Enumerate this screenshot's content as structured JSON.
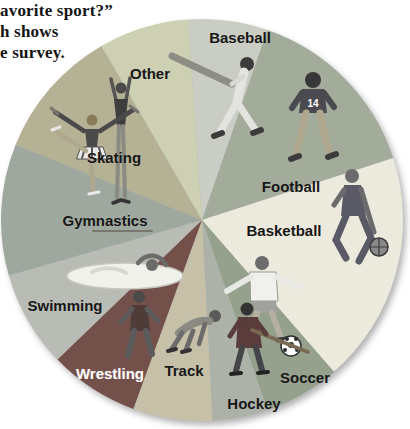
{
  "caption": {
    "line1": "avorite sport?”",
    "line2": "h shows",
    "line3": "e survey."
  },
  "chart_data": {
    "type": "pie",
    "title": "",
    "legend": "none",
    "labels_on_slices": true,
    "angle_convention": "degrees clockwise from 12 o'clock",
    "center": [
      202,
      220
    ],
    "radius": 201,
    "slices": [
      {
        "label": "Baseball",
        "start_deg": -4,
        "end_deg": 19,
        "angle_deg": 23,
        "approx_percent": 6,
        "color": "#c9cdc3",
        "label_color": "#161616",
        "label_pos": [
          240,
          37
        ]
      },
      {
        "label": "Football",
        "start_deg": 19,
        "end_deg": 72,
        "angle_deg": 53,
        "approx_percent": 15,
        "color": "#a3ab9b",
        "label_color": "#161616",
        "label_pos": [
          291,
          186
        ]
      },
      {
        "label": "Basketball",
        "start_deg": 72,
        "end_deg": 139,
        "angle_deg": 67,
        "approx_percent": 19,
        "color": "#eceadd",
        "label_color": "#161616",
        "label_pos": [
          284,
          230
        ]
      },
      {
        "label": "Soccer",
        "start_deg": 139,
        "end_deg": 161,
        "angle_deg": 22,
        "approx_percent": 6,
        "color": "#95a18d",
        "label_color": "#161616",
        "label_pos": [
          305,
          377
        ]
      },
      {
        "label": "Hockey",
        "start_deg": 161,
        "end_deg": 177,
        "angle_deg": 16,
        "approx_percent": 4,
        "color": "#adb2a9",
        "label_color": "#161616",
        "label_pos": [
          254,
          403
        ]
      },
      {
        "label": "Track",
        "start_deg": 177,
        "end_deg": 200,
        "angle_deg": 23,
        "approx_percent": 6,
        "color": "#c6c0a8",
        "label_color": "#161616",
        "label_pos": [
          184,
          370
        ]
      },
      {
        "label": "Wrestling",
        "start_deg": 200,
        "end_deg": 226,
        "angle_deg": 26,
        "approx_percent": 7,
        "color": "#74504b",
        "label_color": "#ffffff",
        "label_pos": [
          110,
          373
        ]
      },
      {
        "label": "Swimming",
        "start_deg": 226,
        "end_deg": 254,
        "angle_deg": 28,
        "approx_percent": 8,
        "color": "#b8bcb4",
        "label_color": "#161616",
        "label_pos": [
          65,
          305
        ]
      },
      {
        "label": "Gymnastics",
        "start_deg": 254,
        "end_deg": 292,
        "angle_deg": 38,
        "approx_percent": 11,
        "color": "#9fa89e",
        "label_color": "#161616",
        "label_pos": [
          105,
          220
        ]
      },
      {
        "label": "Skating",
        "start_deg": 292,
        "end_deg": 330,
        "angle_deg": 38,
        "approx_percent": 11,
        "color": "#b5b194",
        "label_color": "#161616",
        "label_pos": [
          114,
          157
        ]
      },
      {
        "label": "Other",
        "start_deg": 330,
        "end_deg": 356,
        "angle_deg": 26,
        "approx_percent": 7,
        "color": "#cdd0b2",
        "label_color": "#161616",
        "label_pos": [
          150,
          73
        ]
      }
    ]
  },
  "illustrations": {
    "football_jersey_number": "14",
    "figures": [
      "baseball-bat",
      "baseball-batter",
      "football-player",
      "basketball-player",
      "soccer-player",
      "soccer-ball",
      "hockey-player",
      "track-runner",
      "wrestler",
      "swimmer",
      "gymnast",
      "figure-skater"
    ]
  }
}
